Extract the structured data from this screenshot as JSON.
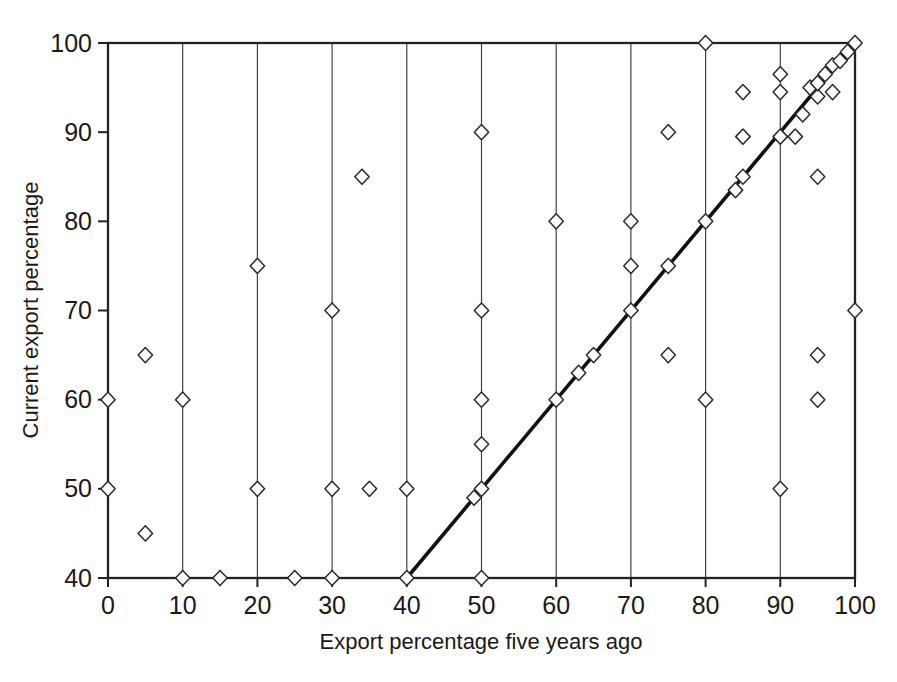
{
  "colors": {
    "paper": "#ffffff",
    "ink": "#191919",
    "frame": "#222222",
    "grid": "#3c3c3c",
    "marker_fill": "#ffffff",
    "marker_stroke": "#2a2a2a",
    "reference_line": "#111111"
  },
  "chart_data": {
    "type": "scatter",
    "title": "",
    "xlabel": "Export percentage five years ago",
    "ylabel": "Current export percentage",
    "xlim": [
      0,
      100
    ],
    "ylim": [
      40,
      100
    ],
    "x_ticks": [
      0,
      10,
      20,
      30,
      40,
      50,
      60,
      70,
      80,
      90,
      100
    ],
    "y_ticks": [
      40,
      50,
      60,
      70,
      80,
      90,
      100
    ],
    "grid": "vertical-only",
    "legend": "none",
    "marker": "open-diamond",
    "points": [
      [
        0,
        50
      ],
      [
        0,
        60
      ],
      [
        5,
        45
      ],
      [
        5,
        65
      ],
      [
        10,
        40
      ],
      [
        10,
        60
      ],
      [
        15,
        40
      ],
      [
        20,
        50
      ],
      [
        20,
        75
      ],
      [
        25,
        40
      ],
      [
        30,
        40
      ],
      [
        30,
        50
      ],
      [
        30,
        70
      ],
      [
        34,
        85
      ],
      [
        35,
        50
      ],
      [
        40,
        40
      ],
      [
        40,
        50
      ],
      [
        49,
        49
      ],
      [
        50,
        40
      ],
      [
        50,
        50
      ],
      [
        50,
        55
      ],
      [
        50,
        60
      ],
      [
        50,
        70
      ],
      [
        50,
        90
      ],
      [
        60,
        60
      ],
      [
        60,
        80
      ],
      [
        63,
        63
      ],
      [
        65,
        65
      ],
      [
        70,
        70
      ],
      [
        70,
        75
      ],
      [
        70,
        80
      ],
      [
        75,
        65
      ],
      [
        75,
        75
      ],
      [
        75,
        90
      ],
      [
        80,
        60
      ],
      [
        80,
        80
      ],
      [
        80,
        100
      ],
      [
        84,
        83.5
      ],
      [
        85,
        85
      ],
      [
        85,
        89.5
      ],
      [
        85,
        94.5
      ],
      [
        90,
        50
      ],
      [
        90,
        89.5
      ],
      [
        90,
        94.5
      ],
      [
        90,
        96.5
      ],
      [
        92,
        89.5
      ],
      [
        93,
        92
      ],
      [
        94,
        95
      ],
      [
        95,
        60
      ],
      [
        95,
        65
      ],
      [
        95,
        85
      ],
      [
        95,
        94
      ],
      [
        95,
        95.5
      ],
      [
        96,
        96.5
      ],
      [
        97,
        94.5
      ],
      [
        97,
        97.5
      ],
      [
        98,
        98
      ],
      [
        99,
        99
      ],
      [
        100,
        70
      ],
      [
        100,
        100
      ]
    ],
    "reference_line": {
      "from": [
        40,
        40
      ],
      "to": [
        100,
        100
      ]
    }
  }
}
